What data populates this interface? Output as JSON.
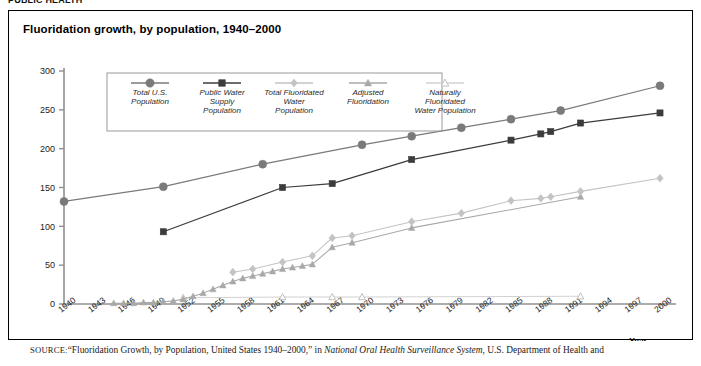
{
  "page": {
    "cut_header": "PUBLIC HEALTH",
    "figure_title": "Fluoridation growth, by population, 1940–2000"
  },
  "source": {
    "label": "SOURCE:",
    "part1": "“Fluoridation Growth, by Population, United States 1940–2000,” in ",
    "italic": "National Oral Health Surveillance System",
    "part2": ", U.S. Department of Health and"
  },
  "colors": {
    "total_us": "#7a7a7a",
    "public_water": "#3c3c3c",
    "total_fluoridated": "#c3c3c3",
    "adjusted": "#a8a8a8",
    "naturally": "#d2d2d2",
    "axis": "#909090",
    "frame": "#000000",
    "background": "#ffffff"
  },
  "chart_data": {
    "type": "line",
    "title": "Fluoridation growth, by population, 1940–2000",
    "xlabel": "Year",
    "ylabel": "",
    "xlim": [
      1940,
      2000
    ],
    "ylim": [
      0,
      300
    ],
    "ytick_values": [
      0,
      50,
      100,
      150,
      200,
      250,
      300
    ],
    "xtick_values": [
      1940,
      1943,
      1946,
      1949,
      1952,
      1955,
      1958,
      1961,
      1964,
      1967,
      1970,
      1973,
      1976,
      1979,
      1982,
      1985,
      1988,
      1991,
      1994,
      1997,
      2000
    ],
    "grid": false,
    "legend_position": "top-left-inside",
    "units": "millions of people",
    "series": [
      {
        "name": "Total U.S. Population",
        "marker": "circle",
        "color": "#7a7a7a",
        "points": [
          {
            "x": 1940,
            "y": 132
          },
          {
            "x": 1950,
            "y": 151
          },
          {
            "x": 1960,
            "y": 180
          },
          {
            "x": 1970,
            "y": 205
          },
          {
            "x": 1975,
            "y": 216
          },
          {
            "x": 1980,
            "y": 227
          },
          {
            "x": 1985,
            "y": 238
          },
          {
            "x": 1990,
            "y": 249
          },
          {
            "x": 2000,
            "y": 281
          }
        ]
      },
      {
        "name": "Public Water Supply Population",
        "marker": "square",
        "color": "#3c3c3c",
        "points": [
          {
            "x": 1950,
            "y": 93
          },
          {
            "x": 1962,
            "y": 150
          },
          {
            "x": 1967,
            "y": 155
          },
          {
            "x": 1975,
            "y": 186
          },
          {
            "x": 1985,
            "y": 211
          },
          {
            "x": 1988,
            "y": 219
          },
          {
            "x": 1989,
            "y": 222
          },
          {
            "x": 1992,
            "y": 233
          },
          {
            "x": 2000,
            "y": 246
          }
        ]
      },
      {
        "name": "Total Fluoridated Water Population",
        "marker": "diamond",
        "color": "#c3c3c3",
        "points": [
          {
            "x": 1957,
            "y": 41
          },
          {
            "x": 1959,
            "y": 45
          },
          {
            "x": 1962,
            "y": 54
          },
          {
            "x": 1965,
            "y": 62
          },
          {
            "x": 1967,
            "y": 85
          },
          {
            "x": 1969,
            "y": 88
          },
          {
            "x": 1975,
            "y": 106
          },
          {
            "x": 1980,
            "y": 117
          },
          {
            "x": 1985,
            "y": 133
          },
          {
            "x": 1988,
            "y": 136
          },
          {
            "x": 1989,
            "y": 138
          },
          {
            "x": 1992,
            "y": 145
          },
          {
            "x": 2000,
            "y": 162
          }
        ]
      },
      {
        "name": "Adjusted Fluoridation",
        "marker": "triangle",
        "color": "#a8a8a8",
        "points": [
          {
            "x": 1945,
            "y": 1
          },
          {
            "x": 1946,
            "y": 1
          },
          {
            "x": 1947,
            "y": 1
          },
          {
            "x": 1948,
            "y": 2
          },
          {
            "x": 1949,
            "y": 2
          },
          {
            "x": 1950,
            "y": 3
          },
          {
            "x": 1951,
            "y": 4
          },
          {
            "x": 1952,
            "y": 6
          },
          {
            "x": 1953,
            "y": 10
          },
          {
            "x": 1954,
            "y": 14
          },
          {
            "x": 1955,
            "y": 19
          },
          {
            "x": 1956,
            "y": 24
          },
          {
            "x": 1957,
            "y": 29
          },
          {
            "x": 1958,
            "y": 33
          },
          {
            "x": 1959,
            "y": 36
          },
          {
            "x": 1960,
            "y": 39
          },
          {
            "x": 1961,
            "y": 42
          },
          {
            "x": 1962,
            "y": 45
          },
          {
            "x": 1963,
            "y": 47
          },
          {
            "x": 1964,
            "y": 49
          },
          {
            "x": 1965,
            "y": 51
          },
          {
            "x": 1967,
            "y": 73
          },
          {
            "x": 1969,
            "y": 79
          },
          {
            "x": 1975,
            "y": 98
          },
          {
            "x": 1992,
            "y": 138
          }
        ]
      },
      {
        "name": "Naturally Fluoridated Water Population",
        "marker": "triangle-open",
        "color": "#d2d2d2",
        "points": [
          {
            "x": 1952,
            "y": 8
          },
          {
            "x": 1962,
            "y": 9
          },
          {
            "x": 1967,
            "y": 9
          },
          {
            "x": 1970,
            "y": 9
          },
          {
            "x": 1992,
            "y": 10
          }
        ]
      }
    ]
  },
  "legend": {
    "entries": [
      {
        "label_lines": [
          "Total U.S.",
          "Population"
        ],
        "marker": "circle",
        "color": "#7a7a7a"
      },
      {
        "label_lines": [
          "Public Water",
          "Supply",
          "Population"
        ],
        "marker": "square",
        "color": "#3c3c3c"
      },
      {
        "label_lines": [
          "Total Fluoridated",
          "Water",
          "Population"
        ],
        "marker": "diamond",
        "color": "#c3c3c3"
      },
      {
        "label_lines": [
          "Adjusted",
          "Fluoridation"
        ],
        "marker": "triangle",
        "color": "#a8a8a8"
      },
      {
        "label_lines": [
          "Naturally",
          "Fluoridated",
          "Water Population"
        ],
        "marker": "triangle-open",
        "color": "#d2d2d2"
      }
    ]
  }
}
